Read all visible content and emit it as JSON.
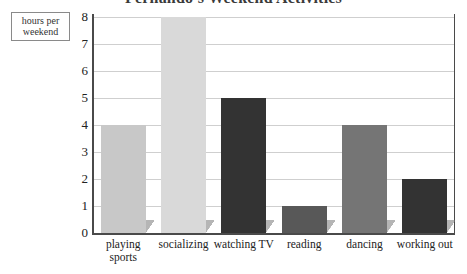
{
  "chart_data": {
    "type": "bar",
    "title": "Fernando's Weekend Activities",
    "xlabel": "",
    "ylabel": "hours per weekend",
    "categories": [
      "playing sports",
      "socializing",
      "watching TV",
      "reading",
      "dancing",
      "working out"
    ],
    "values": [
      4,
      8,
      5,
      1,
      4,
      2
    ],
    "bar_colors": [
      "#c8c8c8",
      "#d9d9d9",
      "#333333",
      "#585858",
      "#757575",
      "#333333"
    ],
    "ylim": [
      0,
      8
    ],
    "yticks": [
      0,
      1,
      2,
      3,
      4,
      5,
      6,
      7,
      8
    ],
    "ytick_labels": [
      "0",
      "1",
      "2",
      "3",
      "4",
      "5",
      "6",
      "7",
      "8"
    ],
    "grid": true,
    "legend": "none",
    "series": [
      {
        "name": "hours per weekend",
        "values": [
          4,
          8,
          5,
          1,
          4,
          2
        ]
      }
    ]
  },
  "axis": {
    "y_caption_line1": "hours per",
    "y_caption_line2": "weekend"
  }
}
